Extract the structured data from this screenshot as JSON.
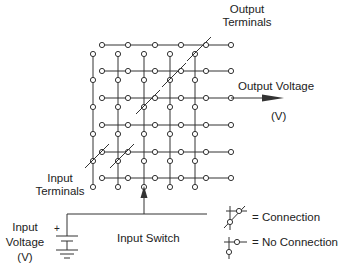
{
  "diagram": {
    "type": "crossbar switch matrix",
    "rows": 6,
    "columns": 5,
    "labels": {
      "output_terminals_1": "Output",
      "output_terminals_2": "Terminals",
      "output_voltage": "Output Voltage",
      "output_voltage_unit": "(V)",
      "input_terminals_1": "Input",
      "input_terminals_2": "Terminals",
      "input_voltage_1": "Input",
      "input_voltage_2": "Voltage",
      "input_voltage_unit": "(V)",
      "input_switch": "Input Switch",
      "battery_plus": "+"
    },
    "legend": {
      "connection": "= Connection",
      "no_connection": "= No Connection"
    },
    "connections": [
      {
        "row": 0,
        "col": 4
      },
      {
        "row": 1,
        "col": 3
      },
      {
        "row": 2,
        "col": 2
      },
      {
        "row": 4,
        "col": 0
      },
      {
        "row": 4,
        "col": 1
      }
    ],
    "output_row": 2,
    "input_column": 2,
    "colors": {
      "line": "#333333",
      "text": "#222222",
      "background": "#ffffff"
    }
  }
}
